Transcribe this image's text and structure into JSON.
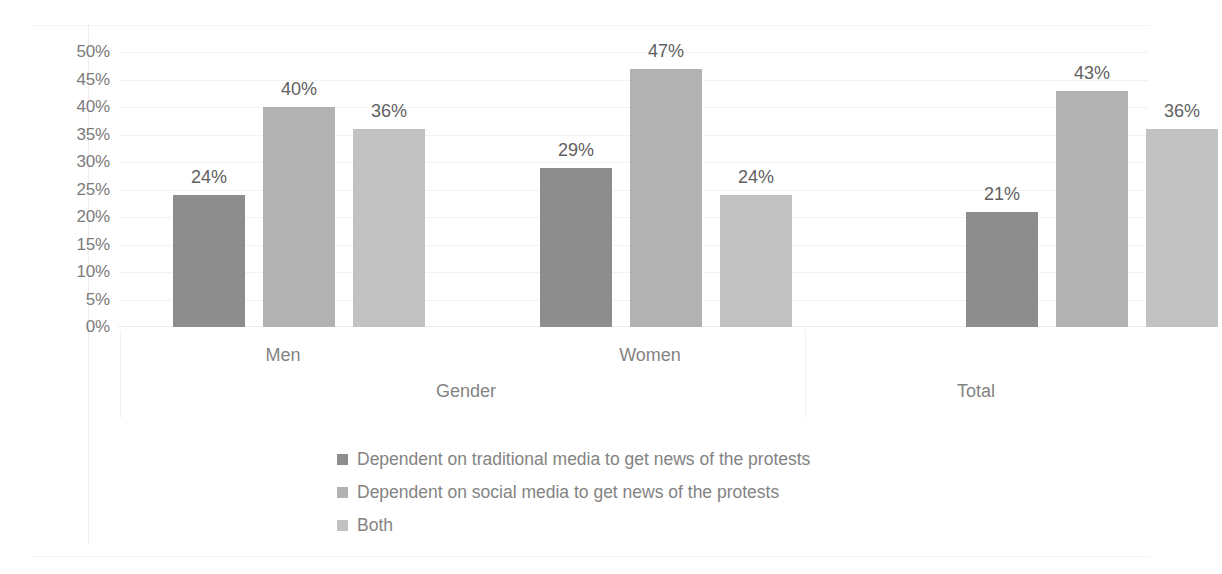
{
  "chart_data": {
    "type": "bar",
    "title": "",
    "subtitle": "",
    "xlabel": "",
    "ylabel": "",
    "categories": [
      "Men",
      "Women",
      "Total"
    ],
    "group_labels": [
      "Gender",
      "Total"
    ],
    "series": [
      {
        "name": "Dependent on traditional media to get news of the protests",
        "color": "#8d8d8d",
        "values": [
          24,
          29,
          21
        ],
        "labels": [
          "24%",
          "29%",
          "21%"
        ]
      },
      {
        "name": "Dependent on social media to get news of the protests",
        "color": "#b2b2b2",
        "values": [
          40,
          47,
          43
        ],
        "labels": [
          "40%",
          "47%",
          "43%"
        ]
      },
      {
        "name": "Both",
        "color": "#c2c2c2",
        "values": [
          36,
          24,
          36
        ],
        "labels": [
          "36%",
          "24%",
          "36%"
        ]
      }
    ],
    "ylim": [
      0,
      50
    ],
    "ytick_step": 5,
    "ytick_labels": [
      "50%",
      "45%",
      "40%",
      "35%",
      "30%",
      "25%",
      "20%",
      "15%",
      "10%",
      "5%",
      "0%"
    ],
    "ytick_values": [
      50,
      45,
      40,
      35,
      30,
      25,
      20,
      15,
      10,
      5,
      0
    ],
    "grid": true,
    "legend_position": "bottom",
    "data_labels": true
  },
  "axis": {
    "category_row": [
      {
        "label": "Men",
        "x": 283
      },
      {
        "label": "Women",
        "x": 650
      }
    ],
    "group_row": [
      {
        "label": "Gender",
        "x": 466
      },
      {
        "label": "Total",
        "x": 976
      }
    ]
  },
  "legend": {
    "items": [
      {
        "label": "Dependent on traditional media to get news of the protests",
        "color": "#8d8d8d"
      },
      {
        "label": "Dependent on social media to get news of the protests",
        "color": "#b2b2b2"
      },
      {
        "label": "Both",
        "color": "#c2c2c2"
      }
    ]
  }
}
